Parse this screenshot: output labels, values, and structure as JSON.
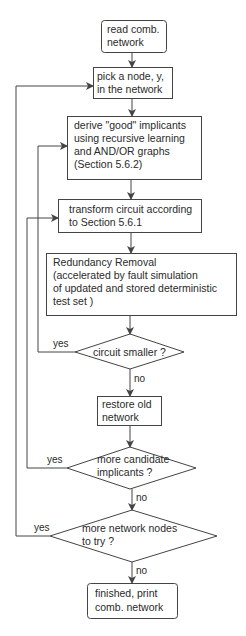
{
  "diagram": {
    "type": "flowchart",
    "colors": {
      "stroke": "#444444",
      "text": "#2a2a2a",
      "background": "#ffffff"
    },
    "nodes": [
      {
        "id": "read",
        "shape": "rounded-rect",
        "lines": [
          "read comb.",
          "network"
        ]
      },
      {
        "id": "pick",
        "shape": "rect",
        "lines": [
          "pick a node, y,",
          "in the network"
        ]
      },
      {
        "id": "derive",
        "shape": "rect",
        "lines": [
          "derive \"good\" implicants",
          "using recursive learning",
          "and AND/OR graphs",
          "(Section 5.6.2)"
        ]
      },
      {
        "id": "transform",
        "shape": "rect",
        "lines": [
          "transform circuit according",
          "to Section 5.6.1"
        ]
      },
      {
        "id": "redundancy",
        "shape": "rect",
        "lines": [
          "Redundancy Removal",
          "(accelerated by fault simulation",
          "of updated and stored deterministic",
          "test set )"
        ]
      },
      {
        "id": "smaller",
        "shape": "diamond",
        "lines": [
          "circuit smaller ?"
        ]
      },
      {
        "id": "restore",
        "shape": "rect",
        "lines": [
          "restore old",
          "network"
        ]
      },
      {
        "id": "candidates",
        "shape": "diamond",
        "lines": [
          "more candidate",
          "implicants ?"
        ]
      },
      {
        "id": "nodes",
        "shape": "diamond",
        "lines": [
          "more network nodes",
          "to try ?"
        ]
      },
      {
        "id": "finished",
        "shape": "rounded-rect",
        "lines": [
          "finished, print",
          "comb. network"
        ]
      }
    ],
    "edge_labels": {
      "smaller_yes": "yes",
      "smaller_no": "no",
      "candidates_yes": "yes",
      "candidates_no": "no",
      "nodes_yes": "yes",
      "nodes_no": "no"
    },
    "edges": [
      {
        "from": "read",
        "to": "pick"
      },
      {
        "from": "pick",
        "to": "derive"
      },
      {
        "from": "derive",
        "to": "transform"
      },
      {
        "from": "transform",
        "to": "redundancy"
      },
      {
        "from": "redundancy",
        "to": "smaller"
      },
      {
        "from": "smaller",
        "to": "transform",
        "label": "yes"
      },
      {
        "from": "smaller",
        "to": "restore",
        "label": "no"
      },
      {
        "from": "restore",
        "to": "candidates"
      },
      {
        "from": "candidates",
        "to": "derive",
        "label": "yes"
      },
      {
        "from": "candidates",
        "to": "nodes",
        "label": "no"
      },
      {
        "from": "nodes",
        "to": "pick",
        "label": "yes"
      },
      {
        "from": "nodes",
        "to": "finished",
        "label": "no"
      }
    ]
  }
}
